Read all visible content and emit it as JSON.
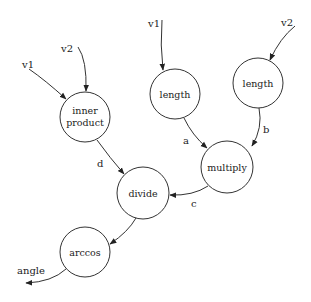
{
  "diagram": {
    "nodes": [
      {
        "id": "inner_product",
        "label_lines": [
          "inner",
          "product"
        ],
        "cx": 85,
        "cy": 117,
        "r": 25
      },
      {
        "id": "length1",
        "label": "length",
        "cx": 175,
        "cy": 94,
        "r": 25
      },
      {
        "id": "length2",
        "label": "length",
        "cx": 258,
        "cy": 83,
        "r": 25
      },
      {
        "id": "multiply",
        "label": "multiply",
        "cx": 227,
        "cy": 167,
        "r": 26
      },
      {
        "id": "divide",
        "label": "divide",
        "cx": 143,
        "cy": 193,
        "r": 26
      },
      {
        "id": "arccos",
        "label": "arccos",
        "cx": 85,
        "cy": 252,
        "r": 25
      }
    ],
    "inputs": {
      "ip_v1": "v1",
      "ip_v2": "v2",
      "len1_v1": "v1",
      "len2_v2": "v2"
    },
    "edges": [
      {
        "from": "v1",
        "to": "inner_product",
        "label": ""
      },
      {
        "from": "v2",
        "to": "inner_product",
        "label": ""
      },
      {
        "from": "v1",
        "to": "length1",
        "label": ""
      },
      {
        "from": "v2",
        "to": "length2",
        "label": ""
      },
      {
        "from": "length1",
        "to": "multiply",
        "label": "a"
      },
      {
        "from": "length2",
        "to": "multiply",
        "label": "b"
      },
      {
        "from": "multiply",
        "to": "divide",
        "label": "c"
      },
      {
        "from": "inner_product",
        "to": "divide",
        "label": "d"
      },
      {
        "from": "divide",
        "to": "arccos",
        "label": ""
      },
      {
        "from": "arccos",
        "to": "output",
        "label": "angle"
      }
    ],
    "edge_labels": {
      "a": "a",
      "b": "b",
      "c": "c",
      "d": "d"
    },
    "output": "angle"
  }
}
